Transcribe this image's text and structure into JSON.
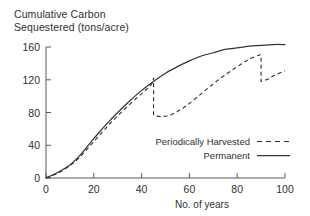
{
  "chart_data": {
    "type": "line",
    "title": "Cumulative Carbon\nSequestered (tons/acre)",
    "xlabel": "No. of years",
    "ylabel": "Cumulative Carbon Sequestered (tons/acre)",
    "xlim": [
      0,
      100
    ],
    "ylim": [
      0,
      160
    ],
    "xticks": [
      0,
      20,
      40,
      60,
      80,
      100
    ],
    "yticks": [
      0,
      40,
      80,
      120,
      160
    ],
    "xtick_labels": [
      "0",
      "20",
      "40",
      "60",
      "80",
      "100"
    ],
    "ytick_labels": [
      "0",
      "40",
      "80",
      "120",
      "160"
    ],
    "grid": false,
    "legend_position": "inside-lower-right",
    "legend": [
      {
        "name": "Periodically Harvested",
        "style": "dashed"
      },
      {
        "name": "Permanent",
        "style": "solid"
      }
    ],
    "series": [
      {
        "name": "Permanent",
        "style": "solid",
        "x": [
          0,
          5,
          10,
          14,
          18,
          22,
          26,
          30,
          35,
          40,
          45,
          50,
          55,
          60,
          65,
          70,
          75,
          80,
          85,
          90,
          95,
          100
        ],
        "y": [
          0,
          7,
          16,
          27,
          41,
          55,
          68,
          80,
          94,
          107,
          118,
          128,
          136,
          143,
          149,
          153,
          157,
          159,
          161,
          162,
          163,
          163
        ]
      },
      {
        "name": "Periodically Harvested",
        "style": "dashed",
        "x": [
          0,
          5,
          10,
          14,
          18,
          22,
          26,
          30,
          35,
          40,
          44,
          45,
          45,
          48,
          52,
          56,
          60,
          65,
          70,
          75,
          80,
          85,
          89,
          90,
          90,
          93,
          96,
          100
        ],
        "y": [
          0,
          6,
          15,
          25,
          38,
          51,
          64,
          76,
          90,
          103,
          114,
          122,
          77,
          75,
          77,
          83,
          91,
          103,
          115,
          126,
          136,
          145,
          150,
          150,
          118,
          121,
          126,
          131
        ],
        "harvest_events": [
          {
            "year": 45,
            "before": 122,
            "after": 77
          },
          {
            "year": 90,
            "before": 150,
            "after": 118
          }
        ]
      }
    ]
  },
  "axes": {
    "x_caption": "No. of years"
  },
  "colors": {
    "line": "#343434",
    "axis": "#5a5a5a",
    "text": "#2f2f2f",
    "background": "#ffffff"
  }
}
